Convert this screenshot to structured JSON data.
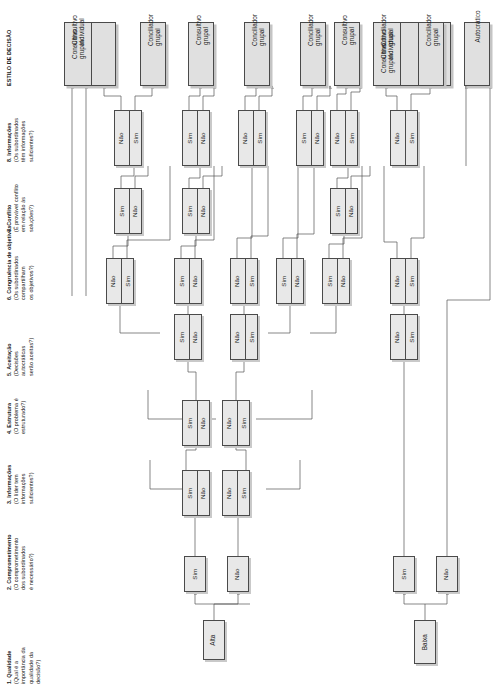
{
  "diagram": {
    "labels": {
      "sim": "Sim",
      "nao": "Nao_",
      "alta": "Alta",
      "baixa": "Baixa"
    }
  },
  "columns": [
    {
      "id": "c1",
      "number": "1.",
      "name": "Qualidade",
      "question_lines": [
        "(Qual é a",
        "importância da",
        "qualidade da",
        "decisão?)"
      ]
    },
    {
      "id": "c2",
      "number": "2.",
      "name": "Comprometimento",
      "question_lines": [
        "(O comprometimento",
        "dos subordinados",
        "é necessário?)"
      ]
    },
    {
      "id": "c3",
      "number": "3.",
      "name": "Informações",
      "question_lines": [
        "(O líder tem",
        "informações",
        "suficientes?)"
      ]
    },
    {
      "id": "c4",
      "number": "4.",
      "name": "Estrutura",
      "question_lines": [
        "(O problema é",
        "estruturado?)"
      ]
    },
    {
      "id": "c5",
      "number": "5.",
      "name": "Aceitação",
      "question_lines": [
        "(Decisões",
        "autocráticas",
        "serão aceitas?)"
      ]
    },
    {
      "id": "c6",
      "number": "6.",
      "name": "Congruência de objetivos",
      "question_lines": [
        "(Os subordinados",
        "compartilham",
        "os objetivos?)"
      ]
    },
    {
      "id": "c7",
      "number": "7.",
      "name": "Conflito",
      "question_lines": [
        "(É provável conflito",
        "em relação às",
        "soluções?)"
      ]
    },
    {
      "id": "c8",
      "number": "8.",
      "name": "Informações",
      "question_lines": [
        "(Os subordinados",
        "têm informações",
        "suficientes?)"
      ]
    },
    {
      "id": "c9",
      "number": "",
      "name": "ESTILO DE DECISÃO",
      "question_lines": []
    }
  ],
  "roots": [
    {
      "id": "r-alta",
      "label": "Alta"
    },
    {
      "id": "r-baixa",
      "label": "Baixa"
    }
  ],
  "level2": [
    {
      "id": "n2a",
      "label": "Sim"
    },
    {
      "id": "n2b",
      "label": "Não"
    },
    {
      "id": "n2c",
      "label": "Sim"
    },
    {
      "id": "n2d",
      "label": "Não"
    }
  ],
  "level3": [
    {
      "id": "n3a",
      "top": "Sim",
      "bottom": "Não"
    },
    {
      "id": "n3b",
      "top": "Não",
      "bottom": "Sim"
    }
  ],
  "level4": [
    {
      "id": "n4a",
      "top": "Sim",
      "bottom": "Não"
    },
    {
      "id": "n4b",
      "top": "Não",
      "bottom": "Sim"
    }
  ],
  "level5": [
    {
      "id": "n5a",
      "top": "Sim",
      "bottom": "Não"
    },
    {
      "id": "n5b",
      "top": "Não",
      "bottom": "Sim"
    },
    {
      "id": "n5c",
      "top": "Não",
      "bottom": "Sim"
    }
  ],
  "level6": [
    {
      "id": "n6a",
      "top": "Não",
      "bottom": "Sim"
    },
    {
      "id": "n6b",
      "top": "Sim",
      "bottom": "Não"
    },
    {
      "id": "n6c",
      "top": "Não",
      "bottom": "Sim"
    },
    {
      "id": "n6d",
      "top": "Sim",
      "bottom": "Não"
    },
    {
      "id": "n6e",
      "top": "Sim",
      "bottom": "Não"
    },
    {
      "id": "n6f",
      "top": "Não",
      "bottom": "Sim"
    }
  ],
  "level7": [
    {
      "id": "n7a",
      "top": "Sim",
      "bottom": "Não"
    },
    {
      "id": "n7b",
      "top": "Sim",
      "bottom": "Não"
    },
    {
      "id": "n7c",
      "top": "Sim",
      "bottom": "Não"
    }
  ],
  "level8": [
    {
      "id": "n8a",
      "top": "Não",
      "bottom": "Sim"
    },
    {
      "id": "n8b",
      "top": "Sim",
      "bottom": "Não"
    },
    {
      "id": "n8c",
      "top": "Não",
      "bottom": "Sim"
    },
    {
      "id": "n8d",
      "top": "Sim",
      "bottom": "Não"
    },
    {
      "id": "n8e",
      "top": "Não",
      "bottom": "Sim"
    },
    {
      "id": "n8f",
      "top": "Não",
      "bottom": "Sim"
    }
  ],
  "outcomes": [
    {
      "id": "o1",
      "cells": [
        "Consultivo individual",
        "Consultivo grupal"
      ]
    },
    {
      "id": "o2",
      "cells": [
        "Conciliador grupal"
      ]
    },
    {
      "id": "o3",
      "cells": [
        "Consultivo grupal"
      ]
    },
    {
      "id": "o4",
      "cells": [
        "Conciliador grupal"
      ]
    },
    {
      "id": "o5",
      "cells": [
        "Conciliador grupal"
      ]
    },
    {
      "id": "o6",
      "cells": [
        "Consultivo grupal"
      ]
    },
    {
      "id": "o7",
      "cells": [
        "Conciliador grupal",
        "Consultivo individual",
        "Consultivo grupal"
      ]
    },
    {
      "id": "o8",
      "cells": [
        "Conciliador grupal"
      ]
    },
    {
      "id": "o9",
      "cells": [
        "Autocrático"
      ]
    }
  ]
}
